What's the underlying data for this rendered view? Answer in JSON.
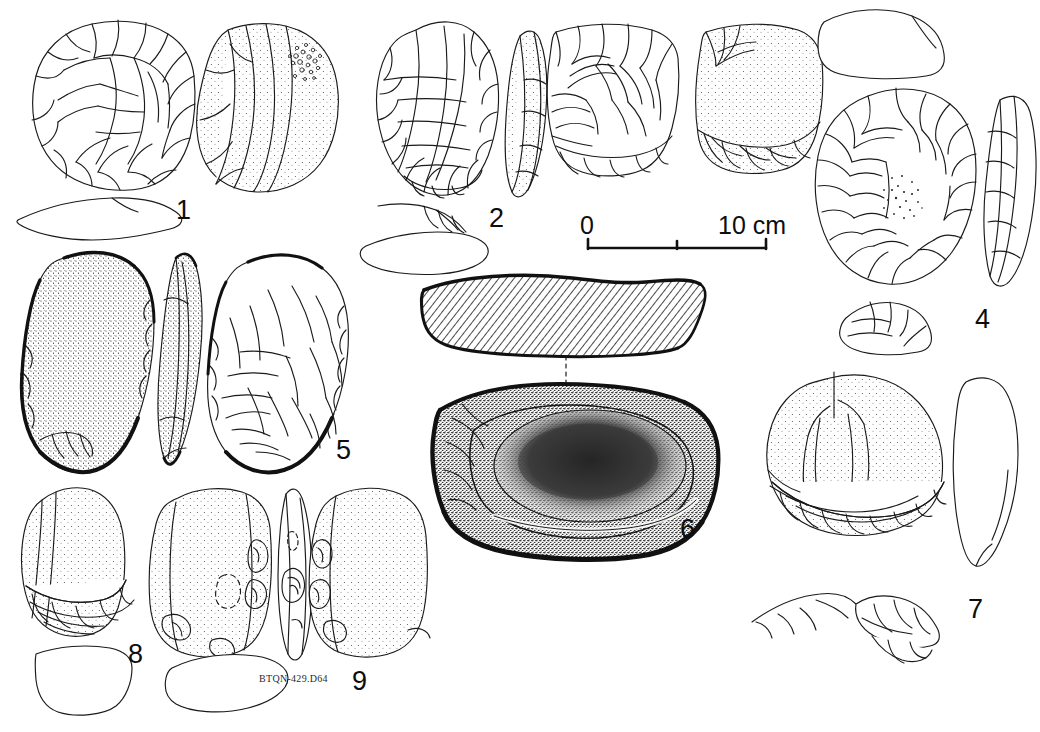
{
  "plate": {
    "background_color": "#ffffff",
    "ink_color": "#1a1a1a",
    "kind": "archaeological-lithic-illustration-plate",
    "catalogue_label": "BTQN-429.D64"
  },
  "scale_bar": {
    "start_label": "0",
    "end_label": "10 cm",
    "minor_tick_at": "5",
    "length_cm": 10
  },
  "figures": [
    {
      "number": "1",
      "name": "discoidal-core",
      "views": [
        "dorsal face with radial flake scars",
        "ventral face with cortex stipple",
        "longitudinal section"
      ]
    },
    {
      "number": "2",
      "name": "ovate-handaxe",
      "views": [
        "dorsal face",
        "lateral profile",
        "edge detail",
        "cross-section"
      ]
    },
    {
      "number": "3",
      "name": "cleaver",
      "views": [
        "dorsal face with flake scars",
        "ventral face with cortex",
        "transverse section"
      ]
    },
    {
      "number": "4",
      "name": "oval-bifacial-core",
      "views": [
        "main face",
        "lateral profile",
        "basal detail"
      ]
    },
    {
      "number": "5",
      "name": "pebble-chopping-tool",
      "views": [
        "cortical face",
        "lateral profile",
        "flaked face"
      ]
    },
    {
      "number": "6",
      "name": "anvil-stone-with-cupule",
      "views": [
        "hatched longitudinal section",
        "plan view with central depression"
      ]
    },
    {
      "number": "7",
      "name": "domed-scraper",
      "views": [
        "dorsal face with retouched edge",
        "lateral profile",
        "edge retouch detail"
      ]
    },
    {
      "number": "8",
      "name": "end-scraper",
      "views": [
        "dorsal face with retouched base",
        "cross-section"
      ]
    },
    {
      "number": "9",
      "name": "hammerstone-pebble",
      "views": [
        "face A with percussion pits",
        "lateral profile",
        "face B",
        "cross-section"
      ]
    }
  ]
}
